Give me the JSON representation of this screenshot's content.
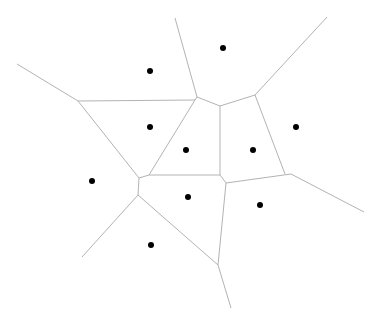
{
  "diagram": {
    "type": "voronoi",
    "width": 375,
    "height": 321,
    "colors": {
      "background": "#ffffff",
      "edge": "#b3b3b3",
      "site": "#000000"
    },
    "site_radius": 3,
    "sites": [
      {
        "x": 150,
        "y": 71
      },
      {
        "x": 223,
        "y": 48
      },
      {
        "x": 150,
        "y": 127
      },
      {
        "x": 186,
        "y": 150
      },
      {
        "x": 253,
        "y": 150
      },
      {
        "x": 296,
        "y": 127
      },
      {
        "x": 92,
        "y": 181
      },
      {
        "x": 188,
        "y": 197
      },
      {
        "x": 260,
        "y": 205
      },
      {
        "x": 151,
        "y": 245
      }
    ],
    "edges": [
      {
        "x1": 17,
        "y1": 64,
        "x2": 78,
        "y2": 101
      },
      {
        "x1": 78,
        "y1": 101,
        "x2": 195,
        "y2": 100
      },
      {
        "x1": 78,
        "y1": 101,
        "x2": 139,
        "y2": 178
      },
      {
        "x1": 175,
        "y1": 18,
        "x2": 197,
        "y2": 97
      },
      {
        "x1": 197,
        "y1": 97,
        "x2": 195,
        "y2": 100
      },
      {
        "x1": 197,
        "y1": 97,
        "x2": 220,
        "y2": 106
      },
      {
        "x1": 195,
        "y1": 100,
        "x2": 149,
        "y2": 175
      },
      {
        "x1": 220,
        "y1": 106,
        "x2": 255,
        "y2": 95
      },
      {
        "x1": 255,
        "y1": 95,
        "x2": 327,
        "y2": 17
      },
      {
        "x1": 255,
        "y1": 95,
        "x2": 285,
        "y2": 174
      },
      {
        "x1": 220,
        "y1": 106,
        "x2": 220,
        "y2": 175
      },
      {
        "x1": 149,
        "y1": 175,
        "x2": 220,
        "y2": 175
      },
      {
        "x1": 139,
        "y1": 178,
        "x2": 149,
        "y2": 175
      },
      {
        "x1": 139,
        "y1": 178,
        "x2": 138,
        "y2": 195
      },
      {
        "x1": 220,
        "y1": 175,
        "x2": 226,
        "y2": 183
      },
      {
        "x1": 226,
        "y1": 183,
        "x2": 291,
        "y2": 174
      },
      {
        "x1": 291,
        "y1": 174,
        "x2": 364,
        "y2": 212
      },
      {
        "x1": 226,
        "y1": 183,
        "x2": 218,
        "y2": 265
      },
      {
        "x1": 138,
        "y1": 195,
        "x2": 218,
        "y2": 265
      },
      {
        "x1": 138,
        "y1": 195,
        "x2": 82,
        "y2": 257
      },
      {
        "x1": 218,
        "y1": 265,
        "x2": 231,
        "y2": 308
      }
    ]
  }
}
